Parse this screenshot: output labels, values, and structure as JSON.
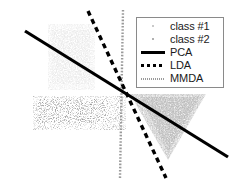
{
  "figure": {
    "width": 244,
    "height": 183,
    "background": "#ffffff"
  },
  "legend": {
    "position": "top-right",
    "border_color": "#8a8a8a",
    "background": "#ffffff",
    "entries": [
      {
        "label": "class #1",
        "marker": "scatter-dot",
        "color": "#c9c9c9",
        "style": "dots"
      },
      {
        "label": "class #2",
        "marker": "scatter-dot",
        "color": "#b0b0b0",
        "style": "dots"
      },
      {
        "label": "PCA",
        "marker": "solid-line",
        "color": "#000000",
        "style": "solid"
      },
      {
        "label": "LDA",
        "marker": "dashed-line",
        "color": "#000000",
        "style": "dashed"
      },
      {
        "label": "MMDA",
        "marker": "dotted-line",
        "color": "#9a9a9a",
        "style": "dotted"
      }
    ]
  },
  "chart_data": {
    "type": "scatter",
    "title": "",
    "xlabel": "",
    "ylabel": "",
    "grid": false,
    "axis_visible": false,
    "xlim": [
      0,
      244
    ],
    "ylim": [
      0,
      183
    ],
    "legend_position": "top-right",
    "series": [
      {
        "name": "class #1",
        "type": "scatter",
        "color": "#c9c9c9",
        "density": "sparse-light",
        "shape": "square-blob",
        "region": {
          "x": 48,
          "y": 24,
          "width": 47,
          "height": 66
        },
        "point_count": 1400
      },
      {
        "name": "class #2",
        "type": "scatter",
        "color": "#7a7a7a",
        "density": "medium-speckle",
        "shape": "horizontal-band",
        "region": {
          "x": 33,
          "y": 96,
          "width": 93,
          "height": 34
        },
        "point_count": 1800
      },
      {
        "name": "class #2",
        "type": "scatter",
        "color": "#8c8c8c",
        "density": "dense",
        "shape": "downward-triangle",
        "region": {
          "x": 130,
          "y": 94,
          "width": 76,
          "height": 66
        },
        "point_count": 2600
      }
    ],
    "lines": [
      {
        "name": "PCA",
        "style": "solid",
        "color": "#000000",
        "width": 3.2,
        "x1": 25,
        "y1": 31,
        "x2": 228,
        "y2": 157,
        "slope": -0.62
      },
      {
        "name": "LDA",
        "style": "dashed",
        "color": "#000000",
        "width": 3.4,
        "dash": "5,4",
        "x1": 88,
        "y1": 11,
        "x2": 166,
        "y2": 178,
        "slope": -2.14
      },
      {
        "name": "MMDA",
        "style": "dotted",
        "color": "#9a9a9a",
        "width": 2.4,
        "dash": "1.6,1.6",
        "x1": 123,
        "y1": 10,
        "x2": 120,
        "y2": 178,
        "slope": -56.0
      }
    ],
    "intersection": {
      "x": 123,
      "y": 93
    }
  }
}
